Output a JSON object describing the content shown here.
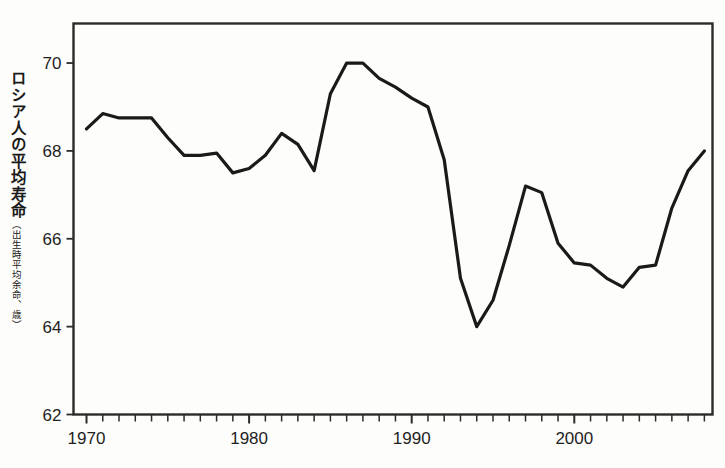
{
  "chart_data": {
    "type": "line",
    "title": "",
    "subtitle": "",
    "xlabel": "",
    "ylabel": "ロシア人の平均寿命",
    "ylabel_sub": "（出生時平均余命、歳）",
    "ylim": [
      62,
      70.9
    ],
    "xlim": [
      1969.2,
      2008.5
    ],
    "yticks": [
      62,
      64,
      66,
      68,
      70
    ],
    "ytick_labels": [
      "62",
      "64",
      "66",
      "68",
      "70"
    ],
    "xticks": [
      1970,
      1980,
      1990,
      2000
    ],
    "xtick_labels": [
      "1970",
      "1980",
      "1990",
      "2000"
    ],
    "xminor_step": 1,
    "grid": false,
    "legend": "none",
    "line_color": "#1a1a18",
    "line_width": 3.2,
    "series": [
      {
        "name": "ロシア人の平均寿命",
        "x": [
          1970,
          1971,
          1972,
          1973,
          1974,
          1975,
          1976,
          1977,
          1978,
          1979,
          1980,
          1981,
          1982,
          1983,
          1984,
          1985,
          1986,
          1987,
          1988,
          1989,
          1990,
          1991,
          1992,
          1993,
          1994,
          1995,
          1996,
          1997,
          1998,
          1999,
          2000,
          2001,
          2002,
          2003,
          2004,
          2005,
          2006,
          2007,
          2008
        ],
        "values": [
          68.5,
          68.85,
          68.75,
          68.75,
          68.75,
          68.3,
          67.9,
          67.9,
          67.95,
          67.5,
          67.6,
          67.9,
          68.4,
          68.15,
          67.55,
          69.3,
          70.0,
          70.0,
          69.65,
          69.45,
          69.2,
          69.0,
          67.8,
          65.1,
          64.0,
          64.6,
          65.85,
          67.2,
          67.05,
          65.9,
          65.45,
          65.4,
          65.1,
          64.9,
          65.35,
          65.4,
          66.7,
          67.55,
          68.0
        ]
      }
    ]
  },
  "axis": {
    "frame_color": "#2b2b28"
  }
}
